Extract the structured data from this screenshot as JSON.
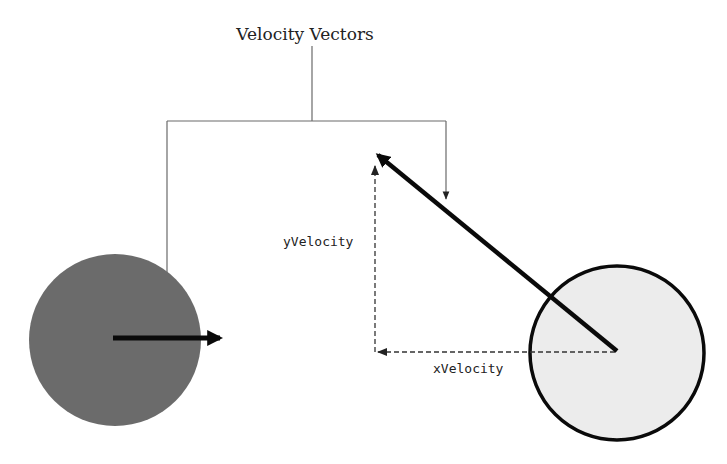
{
  "title": "Velocity Vectors",
  "labels": {
    "y_velocity": "yVelocity",
    "x_velocity": "xVelocity"
  },
  "colors": {
    "left_ball_fill": "#6b6b6b",
    "right_ball_fill": "#ececec",
    "right_ball_stroke": "#0a0a0a",
    "vector_color": "#0a0a0a",
    "callout_line": "#6a6a6a",
    "component_line": "#333333"
  },
  "objects": [
    {
      "name": "left-ball",
      "shape": "circle",
      "description": "dark gray ball moving right"
    },
    {
      "name": "right-ball",
      "shape": "circle",
      "description": "light gray ball moving up-left"
    }
  ]
}
